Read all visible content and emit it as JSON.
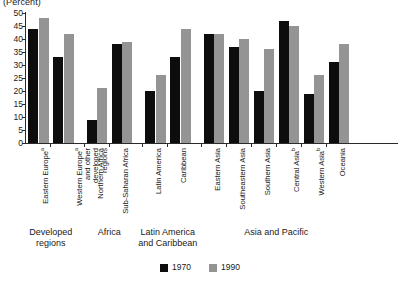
{
  "chart_data": {
    "type": "bar",
    "title": "(Percent)",
    "xlabel": "",
    "ylabel": "(Percent)",
    "ylim": [
      0,
      50
    ],
    "ytick_step": 5,
    "yticks": [
      50,
      45,
      40,
      35,
      30,
      25,
      20,
      15,
      10,
      5,
      0
    ],
    "grid": false,
    "legend_position": "bottom-center",
    "categories": [
      "Eastern Europeᵃ",
      "Western Europeᵃ and other developed regions",
      "Northern Africa",
      "Sub-Saharan Africa",
      "Latin America",
      "Caribbean",
      "Eastern Asia",
      "Southeastern Asia",
      "Southern Asia",
      "Central Asiaᵇ",
      "Western Asiaᵇ",
      "Oceania"
    ],
    "series": [
      {
        "name": "1970",
        "color": "#0d0d0d",
        "values": [
          44,
          33,
          9,
          38,
          20,
          33,
          42,
          37,
          20,
          47,
          19,
          31
        ]
      },
      {
        "name": "1990",
        "color": "#949494",
        "values": [
          48,
          42,
          21,
          39,
          26,
          44,
          42,
          40,
          36,
          45,
          26,
          38
        ]
      }
    ],
    "group_captions": [
      "Developed regions",
      "Africa",
      "Latin America and Caribbean",
      "Asia and Pacific"
    ]
  },
  "axis": {
    "title": "(Percent)",
    "ticks": [
      "50",
      "45",
      "40",
      "35",
      "30",
      "25",
      "20",
      "15",
      "10",
      "5",
      "0"
    ]
  },
  "bars": [
    {
      "label_line1": "Eastern Europe",
      "sup": "a",
      "label_line2": "",
      "label_line3": ""
    },
    {
      "label_line1": "Western Europe",
      "sup": "a",
      "label_line2": "and other developed",
      "label_line3": "regions"
    },
    {
      "label_line1": "Northern Africa",
      "sup": "",
      "label_line2": "",
      "label_line3": ""
    },
    {
      "label_line1": "Sub-Saharan Africa",
      "sup": "",
      "label_line2": "",
      "label_line3": ""
    },
    {
      "label_line1": "Latin America",
      "sup": "",
      "label_line2": "",
      "label_line3": ""
    },
    {
      "label_line1": "Caribbean",
      "sup": "",
      "label_line2": "",
      "label_line3": ""
    },
    {
      "label_line1": "Eastern Asia",
      "sup": "",
      "label_line2": "",
      "label_line3": ""
    },
    {
      "label_line1": "Southeastern Asia",
      "sup": "",
      "label_line2": "",
      "label_line3": ""
    },
    {
      "label_line1": "Southern Asia",
      "sup": "",
      "label_line2": "",
      "label_line3": ""
    },
    {
      "label_line1": "Central Asia",
      "sup": "b",
      "label_line2": "",
      "label_line3": ""
    },
    {
      "label_line1": "Western Asia",
      "sup": "b",
      "label_line2": "",
      "label_line3": ""
    },
    {
      "label_line1": "Oceania",
      "sup": "",
      "label_line2": "",
      "label_line3": ""
    }
  ],
  "groups": [
    {
      "line1": "Developed",
      "line2": "regions"
    },
    {
      "line1": "Africa",
      "line2": ""
    },
    {
      "line1": "Latin America",
      "line2": "and Caribbean"
    },
    {
      "line1": "Asia and Pacific",
      "line2": ""
    }
  ],
  "legend": {
    "items": [
      {
        "label": "1970",
        "color": "#0d0d0d"
      },
      {
        "label": "1990",
        "color": "#949494"
      }
    ]
  }
}
